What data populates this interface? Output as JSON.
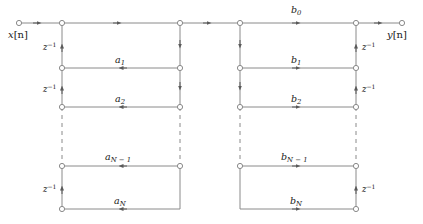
{
  "figure": {
    "type": "signal-flow-graph",
    "colors": {
      "line": "#8a8a8a",
      "node_stroke": "#8a8a8a",
      "node_fill": "#ffffff",
      "arrow": "#5a5a5a",
      "text": "#1a1a1a",
      "background": "#ffffff"
    }
  },
  "terminals": {
    "input_label": "x[n]",
    "input_var": "x",
    "input_index": "[n]",
    "output_label": "y[n]",
    "output_var": "y",
    "output_index": "[n]"
  },
  "feedback_coefficients": {
    "section": "a",
    "items": [
      {
        "label": "a1",
        "symbol": "a",
        "subscript": "1",
        "row": 1
      },
      {
        "label": "a2",
        "symbol": "a",
        "subscript": "2",
        "row": 2
      },
      {
        "label": "aN-1",
        "symbol": "a",
        "subscript": "N − 1",
        "row": 3
      },
      {
        "label": "aN",
        "symbol": "a",
        "subscript": "N",
        "row": 4
      }
    ]
  },
  "feedforward_coefficients": {
    "section": "b",
    "items": [
      {
        "label": "b0",
        "symbol": "b",
        "subscript": "0",
        "row": 0
      },
      {
        "label": "b1",
        "symbol": "b",
        "subscript": "1",
        "row": 1
      },
      {
        "label": "b2",
        "symbol": "b",
        "subscript": "2",
        "row": 2
      },
      {
        "label": "bN-1",
        "symbol": "b",
        "subscript": "N − 1",
        "row": 3
      },
      {
        "label": "bN",
        "symbol": "b",
        "subscript": "N",
        "row": 4
      }
    ]
  },
  "delays": {
    "symbol": "z",
    "exponent": "−1",
    "label": "z−1",
    "count": 4,
    "positions": [
      "left-top",
      "left-bottom",
      "right-top",
      "right-bottom"
    ]
  },
  "continuation": {
    "style": "dashed",
    "meaning": "ellipsis for intermediate stages"
  }
}
